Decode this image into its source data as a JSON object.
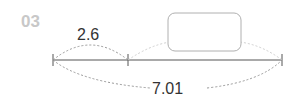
{
  "problem": {
    "number": "03",
    "known_segment": "2.6",
    "total_length": "7.01",
    "unknown_box": ""
  },
  "colors": {
    "line": "#555555",
    "dash": "#999999",
    "dash_light": "#d0d0d0",
    "box_border": "#b0b0b0",
    "number": "#c8c8c8"
  }
}
